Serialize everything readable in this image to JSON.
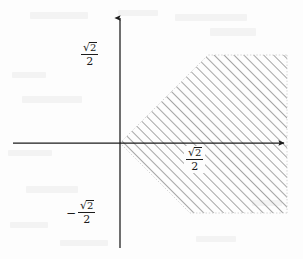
{
  "figure": {
    "kind": "cartesian-plane-inequality-region",
    "background_color": "#fdfdfd",
    "ink_color": "#1b1b1b",
    "hatch_color": "#3a3a3a",
    "width": 303,
    "height": 259
  },
  "axes": {
    "x_axis": {
      "label": "x-axis",
      "y_pixel": 143,
      "x_start_pixel": 13,
      "x_end_pixel": 287,
      "has_arrowhead": true,
      "arrow_direction": "right"
    },
    "y_axis": {
      "label": "y-axis",
      "x_pixel": 120,
      "y_start_pixel": 15,
      "y_end_pixel": 248,
      "has_arrowhead": true,
      "arrow_direction": "up"
    },
    "origin": {
      "x_pixel": 120,
      "y_pixel": 143
    }
  },
  "labels": {
    "y_positive": {
      "name": "y-axis-positive-tick-label",
      "text": "√2/2",
      "sign": "",
      "numerator_radical": "√",
      "numerator_radicand": "2",
      "denominator": "2",
      "value": 0.7071,
      "x_pixel": 83,
      "y_pixel": 48
    },
    "y_negative": {
      "name": "y-axis-negative-tick-label",
      "text": "−√2/2",
      "sign": "−",
      "numerator_radical": "√",
      "numerator_radicand": "2",
      "denominator": "2",
      "value": -0.7071,
      "x_pixel": 70,
      "y_pixel": 206
    },
    "x_positive": {
      "name": "x-axis-tick-label",
      "text": "√2/2",
      "sign": "",
      "numerator_radical": "√",
      "numerator_radicand": "2",
      "denominator": "2",
      "value": 0.7071,
      "x_pixel": 186,
      "y_pixel": 150
    }
  },
  "region": {
    "name": "hatched-wedge-region",
    "description": "Rightward-opening 90-degree wedge with apex at the origin, bounded above and below by horizontal lines and on the right by the plot edge",
    "apex": {
      "x": 120,
      "y": 143
    },
    "upper_edge_slope_degrees": 45,
    "lower_edge_slope_degrees": -45,
    "top_boundary_y_pixel": 55,
    "bottom_boundary_y_pixel": 213,
    "right_boundary_x_pixel": 287,
    "upper_corner": {
      "x": 208,
      "y": 55
    },
    "lower_corner": {
      "x": 190,
      "y": 213
    },
    "hatch": {
      "angle_degrees": 45,
      "direction": "bottom-left-to-top-right",
      "spacing_pixels": 7,
      "stroke_width": 0.9,
      "color": "#3a3a3a"
    },
    "boundary_style": "dotted-light",
    "boundary_color": "#c9c9c9"
  },
  "scan_artifacts": [
    {
      "x": 30,
      "y": 12,
      "w": 58,
      "h": 7
    },
    {
      "x": 118,
      "y": 10,
      "w": 40,
      "h": 6
    },
    {
      "x": 175,
      "y": 14,
      "w": 72,
      "h": 7
    },
    {
      "x": 210,
      "y": 28,
      "w": 46,
      "h": 8
    },
    {
      "x": 12,
      "y": 72,
      "w": 34,
      "h": 6
    },
    {
      "x": 22,
      "y": 96,
      "w": 60,
      "h": 7
    },
    {
      "x": 8,
      "y": 150,
      "w": 44,
      "h": 6
    },
    {
      "x": 26,
      "y": 186,
      "w": 52,
      "h": 7
    },
    {
      "x": 10,
      "y": 222,
      "w": 38,
      "h": 6
    },
    {
      "x": 60,
      "y": 240,
      "w": 48,
      "h": 6
    },
    {
      "x": 196,
      "y": 236,
      "w": 40,
      "h": 6
    },
    {
      "x": 252,
      "y": 200,
      "w": 30,
      "h": 6
    }
  ]
}
